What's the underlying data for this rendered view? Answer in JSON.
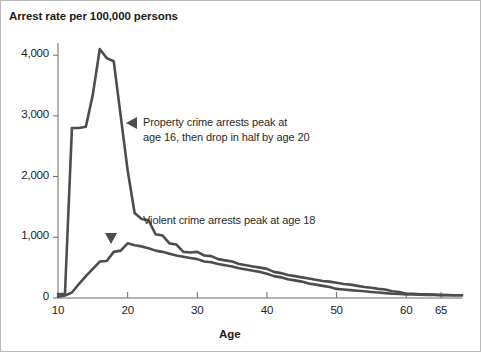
{
  "chart_data": {
    "type": "line",
    "title": "Arrest rate per 100,000 persons",
    "xlabel": "Age",
    "ylabel": "",
    "xlim": [
      10,
      68
    ],
    "ylim": [
      0,
      4200
    ],
    "grid": false,
    "legend_position": "none",
    "x_ticks": [
      "10",
      "20",
      "30",
      "40",
      "50",
      "60",
      "65"
    ],
    "x_tick_values": [
      10,
      20,
      30,
      40,
      50,
      60,
      65
    ],
    "y_ticks": [
      "0",
      "1,000",
      "2,000",
      "3,000",
      "4,000"
    ],
    "y_tick_values": [
      0,
      1000,
      2000,
      3000,
      4000
    ],
    "x": [
      10,
      11,
      12,
      13,
      14,
      15,
      16,
      17,
      18,
      19,
      20,
      21,
      22,
      23,
      24,
      25,
      26,
      27,
      28,
      29,
      30,
      31,
      32,
      33,
      34,
      35,
      36,
      37,
      38,
      39,
      40,
      41,
      42,
      43,
      44,
      45,
      46,
      47,
      48,
      49,
      50,
      51,
      52,
      53,
      54,
      55,
      56,
      57,
      58,
      59,
      60,
      61,
      62,
      63,
      64,
      65,
      66,
      67,
      68
    ],
    "series": [
      {
        "name": "Property crime arrests",
        "values": [
          60,
          70,
          2800,
          2800,
          2820,
          3350,
          4100,
          3950,
          3900,
          3000,
          2100,
          1400,
          1300,
          1280,
          1050,
          1030,
          900,
          880,
          760,
          750,
          760,
          700,
          690,
          640,
          620,
          600,
          560,
          540,
          520,
          500,
          480,
          430,
          410,
          380,
          360,
          340,
          320,
          300,
          280,
          270,
          250,
          230,
          220,
          200,
          180,
          170,
          150,
          140,
          110,
          100,
          70,
          70,
          60,
          60,
          55,
          50,
          50,
          45,
          45
        ]
      },
      {
        "name": "Violent crime arrests",
        "values": [
          20,
          40,
          90,
          230,
          360,
          480,
          600,
          610,
          760,
          780,
          900,
          870,
          850,
          820,
          780,
          760,
          730,
          700,
          680,
          660,
          640,
          600,
          590,
          560,
          540,
          520,
          490,
          470,
          450,
          430,
          400,
          360,
          340,
          310,
          290,
          270,
          240,
          220,
          200,
          180,
          150,
          140,
          130,
          120,
          110,
          100,
          90,
          80,
          70,
          65,
          60,
          58,
          55,
          52,
          50,
          48,
          46,
          45,
          45
        ]
      }
    ],
    "annotations": [
      {
        "id": "property-annotation",
        "text": "Property crime arrests peak at\nage 16, then drop in half by age 20",
        "marker": "left-triangle"
      },
      {
        "id": "violent-annotation",
        "text": "Violent crime arrests peak at age 18",
        "marker": "down-triangle"
      }
    ],
    "colors": {
      "line": "#4d4d4d",
      "axis": "#6b6b6b",
      "text": "#1d1d1d",
      "background": "#ffffff",
      "border": "#b9b9b9"
    }
  }
}
